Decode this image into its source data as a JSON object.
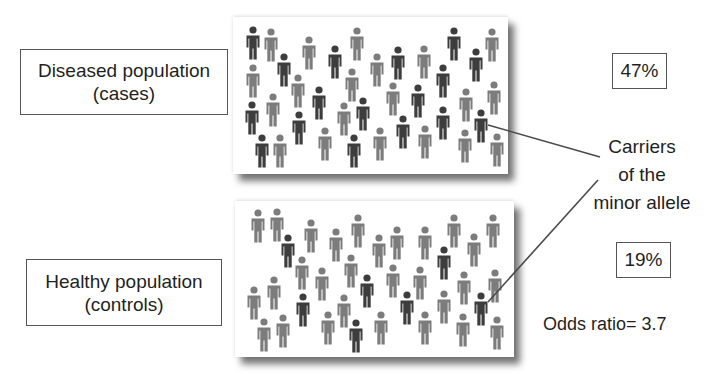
{
  "colors": {
    "carrier": "#3d3d3d",
    "non_carrier": "#7c7c7c",
    "pointer_line": "#4a4a4a",
    "box_border": "#555555"
  },
  "cases": {
    "label_line1": "Diseased population",
    "label_line2": "(cases)",
    "percent": "47%",
    "figures": [
      {
        "x": 253,
        "y": 30,
        "carrier": true
      },
      {
        "x": 271,
        "y": 32,
        "carrier": false
      },
      {
        "x": 284,
        "y": 57,
        "carrier": true
      },
      {
        "x": 309,
        "y": 40,
        "carrier": false
      },
      {
        "x": 335,
        "y": 49,
        "carrier": true
      },
      {
        "x": 357,
        "y": 31,
        "carrier": false
      },
      {
        "x": 377,
        "y": 57,
        "carrier": false
      },
      {
        "x": 398,
        "y": 50,
        "carrier": true
      },
      {
        "x": 424,
        "y": 49,
        "carrier": false
      },
      {
        "x": 443,
        "y": 68,
        "carrier": true
      },
      {
        "x": 454,
        "y": 31,
        "carrier": true
      },
      {
        "x": 476,
        "y": 52,
        "carrier": true
      },
      {
        "x": 492,
        "y": 32,
        "carrier": false
      },
      {
        "x": 253,
        "y": 68,
        "carrier": false
      },
      {
        "x": 298,
        "y": 78,
        "carrier": false
      },
      {
        "x": 319,
        "y": 90,
        "carrier": true
      },
      {
        "x": 352,
        "y": 72,
        "carrier": false
      },
      {
        "x": 393,
        "y": 86,
        "carrier": false
      },
      {
        "x": 418,
        "y": 88,
        "carrier": true
      },
      {
        "x": 466,
        "y": 92,
        "carrier": false
      },
      {
        "x": 494,
        "y": 85,
        "carrier": false
      },
      {
        "x": 273,
        "y": 97,
        "carrier": false
      },
      {
        "x": 252,
        "y": 105,
        "carrier": true
      },
      {
        "x": 299,
        "y": 115,
        "carrier": true
      },
      {
        "x": 344,
        "y": 106,
        "carrier": false
      },
      {
        "x": 363,
        "y": 101,
        "carrier": true
      },
      {
        "x": 403,
        "y": 119,
        "carrier": true
      },
      {
        "x": 443,
        "y": 110,
        "carrier": true
      },
      {
        "x": 481,
        "y": 113,
        "carrier": true
      },
      {
        "x": 262,
        "y": 138,
        "carrier": true
      },
      {
        "x": 280,
        "y": 138,
        "carrier": false
      },
      {
        "x": 325,
        "y": 131,
        "carrier": false
      },
      {
        "x": 354,
        "y": 138,
        "carrier": true
      },
      {
        "x": 380,
        "y": 131,
        "carrier": false
      },
      {
        "x": 425,
        "y": 129,
        "carrier": false
      },
      {
        "x": 465,
        "y": 133,
        "carrier": false
      },
      {
        "x": 497,
        "y": 137,
        "carrier": false
      }
    ]
  },
  "controls": {
    "label_line1": "Healthy population",
    "label_line2": "(controls)",
    "percent": "19%",
    "figures": [
      {
        "x": 258,
        "y": 213,
        "carrier": false
      },
      {
        "x": 277,
        "y": 212,
        "carrier": false
      },
      {
        "x": 288,
        "y": 238,
        "carrier": true
      },
      {
        "x": 311,
        "y": 223,
        "carrier": false
      },
      {
        "x": 336,
        "y": 232,
        "carrier": false
      },
      {
        "x": 358,
        "y": 218,
        "carrier": false
      },
      {
        "x": 302,
        "y": 260,
        "carrier": false
      },
      {
        "x": 322,
        "y": 271,
        "carrier": false
      },
      {
        "x": 351,
        "y": 258,
        "carrier": false
      },
      {
        "x": 367,
        "y": 278,
        "carrier": true
      },
      {
        "x": 274,
        "y": 280,
        "carrier": false
      },
      {
        "x": 254,
        "y": 290,
        "carrier": false
      },
      {
        "x": 303,
        "y": 297,
        "carrier": true
      },
      {
        "x": 344,
        "y": 298,
        "carrier": false
      },
      {
        "x": 264,
        "y": 322,
        "carrier": false
      },
      {
        "x": 283,
        "y": 318,
        "carrier": false
      },
      {
        "x": 328,
        "y": 315,
        "carrier": false
      },
      {
        "x": 356,
        "y": 323,
        "carrier": true
      },
      {
        "x": 379,
        "y": 238,
        "carrier": false
      },
      {
        "x": 397,
        "y": 230,
        "carrier": false
      },
      {
        "x": 425,
        "y": 230,
        "carrier": false
      },
      {
        "x": 454,
        "y": 218,
        "carrier": false
      },
      {
        "x": 493,
        "y": 218,
        "carrier": false
      },
      {
        "x": 474,
        "y": 237,
        "carrier": false
      },
      {
        "x": 444,
        "y": 250,
        "carrier": true
      },
      {
        "x": 393,
        "y": 268,
        "carrier": false
      },
      {
        "x": 420,
        "y": 270,
        "carrier": false
      },
      {
        "x": 464,
        "y": 275,
        "carrier": false
      },
      {
        "x": 495,
        "y": 273,
        "carrier": false
      },
      {
        "x": 407,
        "y": 295,
        "carrier": true
      },
      {
        "x": 444,
        "y": 294,
        "carrier": false
      },
      {
        "x": 481,
        "y": 296,
        "carrier": true
      },
      {
        "x": 381,
        "y": 315,
        "carrier": false
      },
      {
        "x": 425,
        "y": 315,
        "carrier": false
      },
      {
        "x": 463,
        "y": 317,
        "carrier": false
      },
      {
        "x": 497,
        "y": 320,
        "carrier": false
      }
    ]
  },
  "annotation": {
    "line1": "Carriers",
    "line2": "of the",
    "line3": "minor allele"
  },
  "odds_ratio": "Odds ratio= 3.7",
  "pointers": [
    {
      "x1": 488,
      "y1": 125,
      "x2": 600,
      "y2": 157
    },
    {
      "x1": 488,
      "y1": 302,
      "x2": 598,
      "y2": 180
    }
  ]
}
